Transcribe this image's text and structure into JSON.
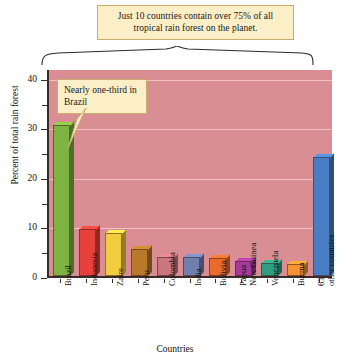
{
  "chart_data": {
    "type": "bar",
    "title": "",
    "xlabel": "Countries",
    "ylabel": "Percent of total rain forest",
    "ylim": [
      0,
      42
    ],
    "ytick_labels": [
      "0",
      "10",
      "20",
      "30",
      "40"
    ],
    "ytick_values": [
      0,
      10,
      20,
      30,
      40
    ],
    "yminor_values": [
      5,
      15,
      25,
      35
    ],
    "grid": true,
    "legend": "none",
    "categories": [
      "Brazil",
      "Indonesia",
      "Zaire",
      "Peru",
      "Colombia",
      "India",
      "Bolivia",
      "Papua New Guinea",
      "Venezuela",
      "Burma",
      "63 other countries"
    ],
    "values": [
      30.5,
      9.5,
      8.6,
      5.5,
      3.8,
      3.8,
      3.6,
      3.0,
      2.6,
      2.5,
      24.0
    ],
    "bar_colors": [
      "#7cb342",
      "#e8403a",
      "#f2cc3f",
      "#b9792a",
      "#c9767f",
      "#6f7fb0",
      "#ea6a2b",
      "#a7399c",
      "#2f9e7e",
      "#f59331",
      "#4a7ec4"
    ],
    "annotations": [
      {
        "id": "top-callout",
        "text": "Just 10 countries contain over 75% of all tropical rain forest on the planet."
      },
      {
        "id": "brazil-callout",
        "text": "Nearly one-third in Brazil"
      }
    ]
  },
  "plot_style": {
    "plot_background": "#d88e93",
    "gridline_color": "#f0c0c2",
    "callout_background": "#fcefc8",
    "callout_border": "#c9ad6a",
    "axis_color": "#3a2a28"
  },
  "axis": {
    "x_title": "Countries",
    "y_title": "Percent of total rain forest"
  },
  "callouts": {
    "top": "Just 10 countries contain over 75% of all tropical rain forest on the planet.",
    "brazil": "Nearly one-third in Brazil"
  }
}
